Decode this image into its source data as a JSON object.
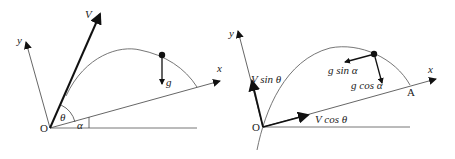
{
  "left_diagram": {
    "origin_label": "O",
    "x_axis_label": "x",
    "y_axis_label": "y",
    "velocity_label": "V",
    "gravity_label": "g",
    "launch_angle_label": "θ",
    "incline_angle_label": "α"
  },
  "right_diagram": {
    "origin_label": "O",
    "x_axis_label": "x",
    "y_axis_label": "y",
    "landing_point_label": "A",
    "v_sin_label": "V sin θ",
    "v_cos_label": "V cos θ",
    "g_sin_label": "g sin α",
    "g_cos_label": "g cos α"
  },
  "colors": {
    "line": "#555555",
    "thick_arrow": "#111111",
    "background": "#ffffff"
  }
}
